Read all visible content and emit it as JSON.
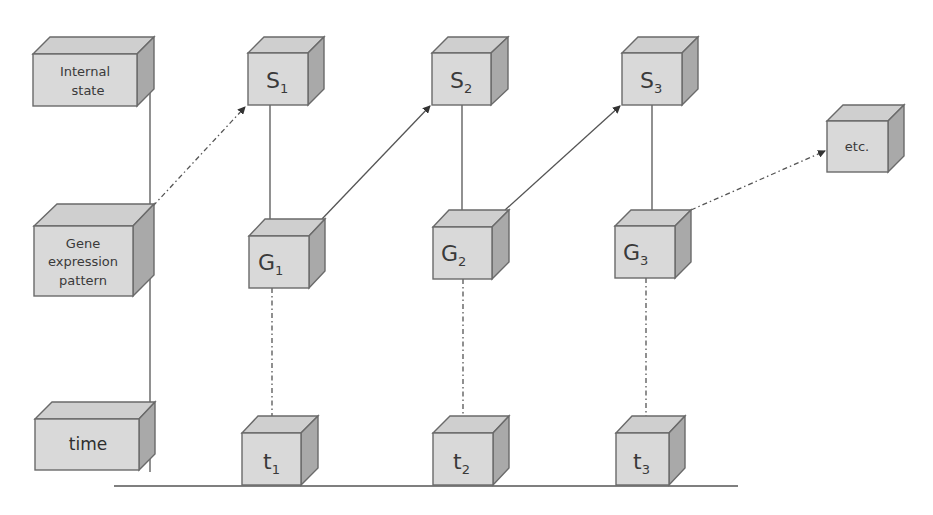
{
  "diagram": {
    "type": "state-transition-timeline",
    "colors": {
      "box_front": "#d9d9d9",
      "box_top": "#cfcfcf",
      "box_side": "#a9a9a9",
      "line": "#555555",
      "text": "#3a3a3a"
    },
    "row_labels": {
      "internal_state": [
        "Internal",
        "state"
      ],
      "gene_expression": [
        "Gene",
        "expression",
        "pattern"
      ],
      "time": "time"
    },
    "states": [
      {
        "base": "S",
        "sub": "1"
      },
      {
        "base": "S",
        "sub": "2"
      },
      {
        "base": "S",
        "sub": "3"
      }
    ],
    "gene_patterns": [
      {
        "base": "G",
        "sub": "1"
      },
      {
        "base": "G",
        "sub": "2"
      },
      {
        "base": "G",
        "sub": "3"
      }
    ],
    "times": [
      {
        "base": "t",
        "sub": "1"
      },
      {
        "base": "t",
        "sub": "2"
      },
      {
        "base": "t",
        "sub": "3"
      }
    ],
    "continuation": "etc.",
    "edges": [
      {
        "from": "Gene expression pattern",
        "to": "S1",
        "style": "dash-dot",
        "arrow": true
      },
      {
        "from": "S1",
        "to": "G1",
        "style": "solid",
        "arrow": true
      },
      {
        "from": "G1",
        "to": "S2",
        "style": "solid",
        "arrow": true
      },
      {
        "from": "S2",
        "to": "G2",
        "style": "solid",
        "arrow": true
      },
      {
        "from": "G2",
        "to": "S3",
        "style": "solid",
        "arrow": true
      },
      {
        "from": "S3",
        "to": "G3",
        "style": "solid",
        "arrow": true
      },
      {
        "from": "G3",
        "to": "etc.",
        "style": "dash-dot",
        "arrow": true
      },
      {
        "from": "G1",
        "to": "t1",
        "style": "dash-dot",
        "arrow": false
      },
      {
        "from": "G2",
        "to": "t2",
        "style": "dash-dot",
        "arrow": false
      },
      {
        "from": "G3",
        "to": "t3",
        "style": "dash-dot",
        "arrow": false
      }
    ]
  }
}
